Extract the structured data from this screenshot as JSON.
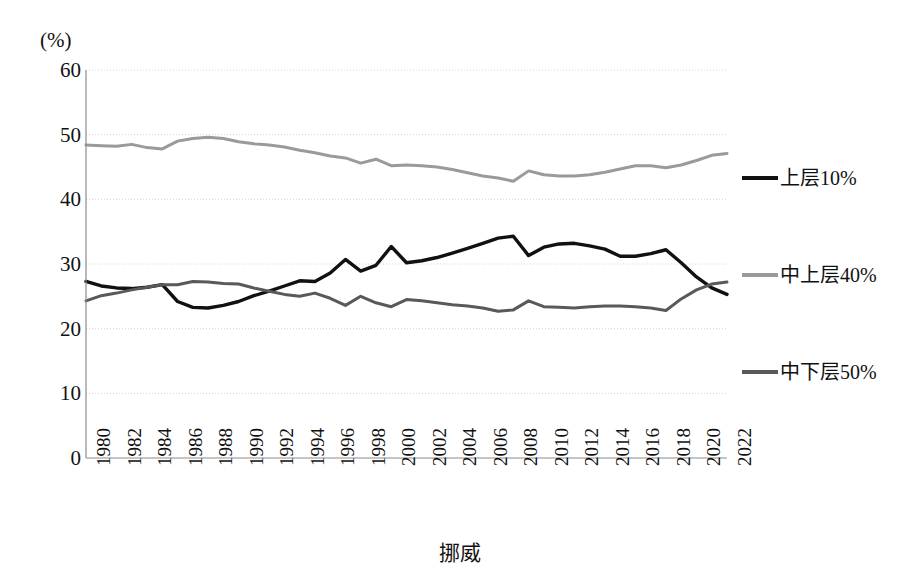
{
  "chart_data": {
    "type": "line",
    "title": "挪威",
    "unit_label": "(%)",
    "xlabel": "",
    "ylabel": "",
    "ylim": [
      0,
      60
    ],
    "ytick_step": 10,
    "yticks": [
      "60",
      "50",
      "40",
      "30",
      "20",
      "10",
      "0"
    ],
    "grid": true,
    "legend_position": "right",
    "xlim": [
      1980,
      2022
    ],
    "xtick_step": 2,
    "xticks": [
      "1980",
      "1982",
      "1984",
      "1986",
      "1988",
      "1990",
      "1992",
      "1994",
      "1996",
      "1998",
      "2000",
      "2002",
      "2004",
      "2006",
      "2008",
      "2010",
      "2012",
      "2014",
      "2016",
      "2018",
      "2020",
      "2022"
    ],
    "x": [
      1980,
      1981,
      1982,
      1983,
      1984,
      1985,
      1986,
      1987,
      1988,
      1989,
      1990,
      1991,
      1992,
      1993,
      1994,
      1995,
      1996,
      1997,
      1998,
      1999,
      2000,
      2001,
      2002,
      2003,
      2004,
      2005,
      2006,
      2007,
      2008,
      2009,
      2010,
      2011,
      2012,
      2013,
      2014,
      2015,
      2016,
      2017,
      2018,
      2019,
      2020,
      2021,
      2022
    ],
    "series": [
      {
        "name": "上层10%",
        "color": "#111111",
        "values": [
          27.3,
          26.6,
          26.3,
          26.2,
          26.4,
          26.8,
          24.2,
          23.3,
          23.2,
          23.6,
          24.2,
          25.1,
          25.8,
          26.6,
          27.4,
          27.3,
          28.6,
          30.7,
          28.9,
          29.8,
          32.7,
          30.2,
          30.5,
          31.0,
          31.7,
          32.4,
          33.2,
          34.0,
          34.3,
          31.3,
          32.6,
          33.1,
          33.2,
          32.8,
          32.3,
          31.2,
          31.2,
          31.6,
          32.2,
          30.2,
          28.0,
          26.3,
          25.3
        ]
      },
      {
        "name": "中上层40%",
        "color": "#9a9a9a",
        "values": [
          48.4,
          48.3,
          48.2,
          48.5,
          48.0,
          47.8,
          49.0,
          49.4,
          49.6,
          49.4,
          48.9,
          48.6,
          48.4,
          48.1,
          47.6,
          47.2,
          46.7,
          46.4,
          45.6,
          46.2,
          45.2,
          45.3,
          45.2,
          45.0,
          44.6,
          44.1,
          43.6,
          43.3,
          42.8,
          44.4,
          43.8,
          43.6,
          43.6,
          43.8,
          44.2,
          44.7,
          45.2,
          45.2,
          44.9,
          45.3,
          46.0,
          46.8,
          47.1
        ]
      },
      {
        "name": "中下层50%",
        "color": "#595959",
        "values": [
          24.3,
          25.1,
          25.5,
          26.0,
          26.4,
          26.8,
          26.8,
          27.3,
          27.2,
          27.0,
          26.9,
          26.3,
          25.8,
          25.3,
          25.0,
          25.5,
          24.7,
          23.6,
          25.0,
          24.0,
          23.4,
          24.5,
          24.3,
          24.0,
          23.7,
          23.5,
          23.2,
          22.7,
          22.9,
          24.3,
          23.4,
          23.3,
          23.2,
          23.4,
          23.5,
          23.5,
          23.4,
          23.2,
          22.8,
          24.6,
          26.0,
          26.9,
          27.2
        ]
      }
    ]
  },
  "legend": {
    "items": [
      {
        "label": "上层10%",
        "color": "#111111"
      },
      {
        "label": "中上层40%",
        "color": "#9a9a9a"
      },
      {
        "label": "中下层50%",
        "color": "#595959"
      }
    ]
  }
}
